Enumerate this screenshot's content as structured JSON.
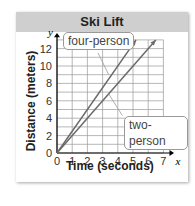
{
  "chart_data": {
    "type": "line",
    "title": "Ski Lift",
    "xlabel": "Time (seconds)",
    "ylabel": "Distance (meters)",
    "x_axis_symbol": "x",
    "y_axis_symbol": "y",
    "xlim": [
      0,
      7
    ],
    "ylim": [
      0,
      12
    ],
    "x_ticks": [
      "0",
      "1",
      "2",
      "3",
      "4",
      "5",
      "6",
      "7"
    ],
    "y_ticks": [
      "0",
      "2",
      "4",
      "6",
      "8",
      "10",
      "12"
    ],
    "grid": true,
    "series": [
      {
        "name": "four-person",
        "x": [
          0,
          4,
          5.2
        ],
        "y": [
          0,
          10,
          13
        ]
      },
      {
        "name": "two-person",
        "x": [
          0,
          4,
          6.5
        ],
        "y": [
          0,
          8,
          13
        ]
      }
    ],
    "annotations": [
      "four-person",
      "two-person"
    ],
    "colors": {
      "line": "#6a6a6a",
      "grid": "#9a9a9a",
      "header": "#cfcfcf"
    }
  }
}
